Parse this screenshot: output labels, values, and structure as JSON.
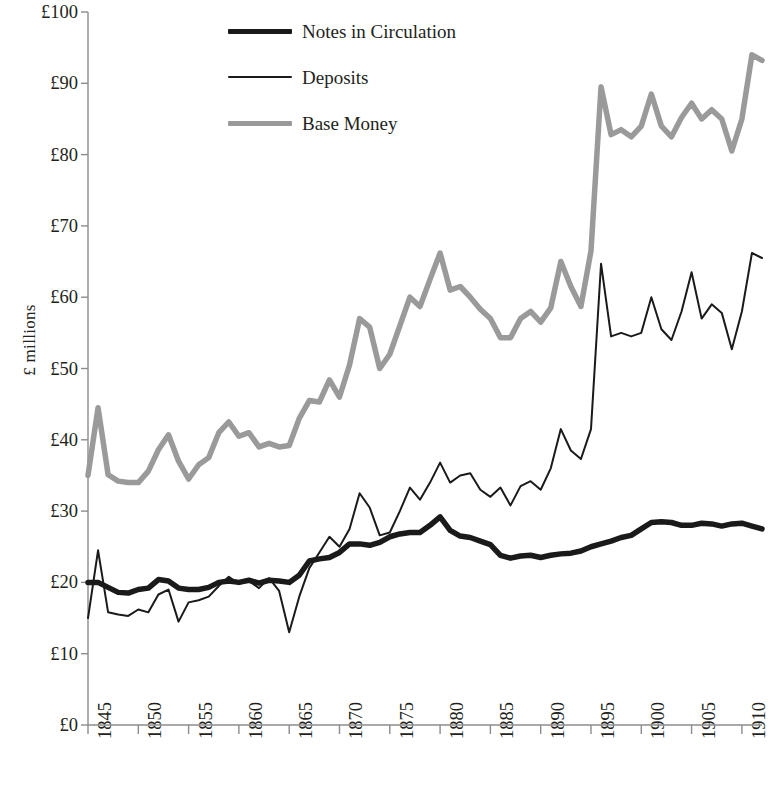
{
  "chart_data": {
    "type": "line",
    "title": "",
    "xlabel": "",
    "ylabel": "£ millions",
    "xlim": [
      1845,
      1912
    ],
    "ylim": [
      0,
      100
    ],
    "grid": false,
    "legend_position": "top-center",
    "y_tick_labels": [
      "£100",
      "£90",
      "£80",
      "£70",
      "£60",
      "£50",
      "£40",
      "£30",
      "£20",
      "£10",
      "£0"
    ],
    "y_tick_values": [
      100,
      90,
      80,
      70,
      60,
      50,
      40,
      30,
      20,
      10,
      0
    ],
    "x_tick_labels": [
      "1845",
      "1850",
      "1855",
      "1860",
      "1865",
      "1870",
      "1875",
      "1880",
      "1885",
      "1890",
      "1895",
      "1900",
      "1905",
      "1910"
    ],
    "x_tick_values": [
      1845,
      1850,
      1855,
      1860,
      1865,
      1870,
      1875,
      1880,
      1885,
      1890,
      1895,
      1900,
      1905,
      1910
    ],
    "x": [
      1845,
      1846,
      1847,
      1848,
      1849,
      1850,
      1851,
      1852,
      1853,
      1854,
      1855,
      1856,
      1857,
      1858,
      1859,
      1860,
      1861,
      1862,
      1863,
      1864,
      1865,
      1866,
      1867,
      1868,
      1869,
      1870,
      1871,
      1872,
      1873,
      1874,
      1875,
      1876,
      1877,
      1878,
      1879,
      1880,
      1881,
      1882,
      1883,
      1884,
      1885,
      1886,
      1887,
      1888,
      1889,
      1890,
      1891,
      1892,
      1893,
      1894,
      1895,
      1896,
      1897,
      1898,
      1899,
      1900,
      1901,
      1902,
      1903,
      1904,
      1905,
      1906,
      1907,
      1908,
      1909,
      1910,
      1911,
      1912
    ],
    "series": [
      {
        "name": "Notes in Circulation",
        "color": "#1a1a1a",
        "width": 5.5,
        "values": [
          20.0,
          20.0,
          19.3,
          18.6,
          18.5,
          19.0,
          19.2,
          20.4,
          20.2,
          19.2,
          19.0,
          19.0,
          19.3,
          20.0,
          20.2,
          20.0,
          20.3,
          19.9,
          20.3,
          20.2,
          20.0,
          21.0,
          23.0,
          23.3,
          23.5,
          24.2,
          25.4,
          25.4,
          25.2,
          25.6,
          26.4,
          26.8,
          27.0,
          27.0,
          28.0,
          29.2,
          27.3,
          26.5,
          26.3,
          25.8,
          25.3,
          23.8,
          23.4,
          23.7,
          23.8,
          23.5,
          23.8,
          24.0,
          24.1,
          24.4,
          25.0,
          25.4,
          25.8,
          26.3,
          26.6,
          27.5,
          28.4,
          28.5,
          28.4,
          28.0,
          28.0,
          28.3,
          28.2,
          27.9,
          28.2,
          28.3,
          27.9,
          27.5
        ]
      },
      {
        "name": "Deposits",
        "color": "#1a1a1a",
        "width": 2,
        "values": [
          15.0,
          24.5,
          15.8,
          15.5,
          15.3,
          16.2,
          15.8,
          18.3,
          19.0,
          14.5,
          17.2,
          17.5,
          18.0,
          19.5,
          20.8,
          19.8,
          20.2,
          19.2,
          20.6,
          18.8,
          13.0,
          18.0,
          22.0,
          24.2,
          26.4,
          25.0,
          27.5,
          32.5,
          30.5,
          26.6,
          27.0,
          30.0,
          33.3,
          31.6,
          34.0,
          36.8,
          34.0,
          35.0,
          35.3,
          33.0,
          32.0,
          33.3,
          30.8,
          33.5,
          34.2,
          33.0,
          36.0,
          41.5,
          38.5,
          37.3,
          41.5,
          64.7,
          54.5,
          55.0,
          54.5,
          55.0,
          60.0,
          55.5,
          54.0,
          58.0,
          63.5,
          57.0,
          59.0,
          57.8,
          52.7,
          58.0,
          66.2,
          65.5
        ]
      },
      {
        "name": "Base Money",
        "color": "#9a9a9a",
        "width": 5.5,
        "values": [
          35.0,
          44.5,
          35.1,
          34.2,
          34.0,
          34.0,
          35.6,
          38.6,
          40.7,
          37.0,
          34.5,
          36.5,
          37.5,
          41.0,
          42.5,
          40.5,
          41.0,
          39.0,
          39.5,
          39.0,
          39.2,
          43.0,
          45.5,
          45.3,
          48.4,
          46.0,
          50.5,
          57.0,
          55.8,
          50.0,
          52.0,
          56.0,
          60.0,
          58.7,
          62.5,
          66.2,
          61.0,
          61.5,
          60.0,
          58.3,
          57.0,
          54.3,
          54.3,
          57.0,
          58.0,
          56.5,
          58.5,
          65.0,
          61.5,
          58.7,
          66.5,
          89.5,
          82.8,
          83.5,
          82.5,
          84.0,
          88.5,
          84.0,
          82.5,
          85.2,
          87.2,
          85.0,
          86.3,
          85.0,
          80.5,
          85.0,
          94.0,
          93.2
        ]
      }
    ]
  },
  "legend": {
    "items": [
      {
        "label": "Notes in Circulation"
      },
      {
        "label": "Deposits"
      },
      {
        "label": "Base Money"
      }
    ]
  },
  "axes": {
    "y_title": "£ millions"
  }
}
